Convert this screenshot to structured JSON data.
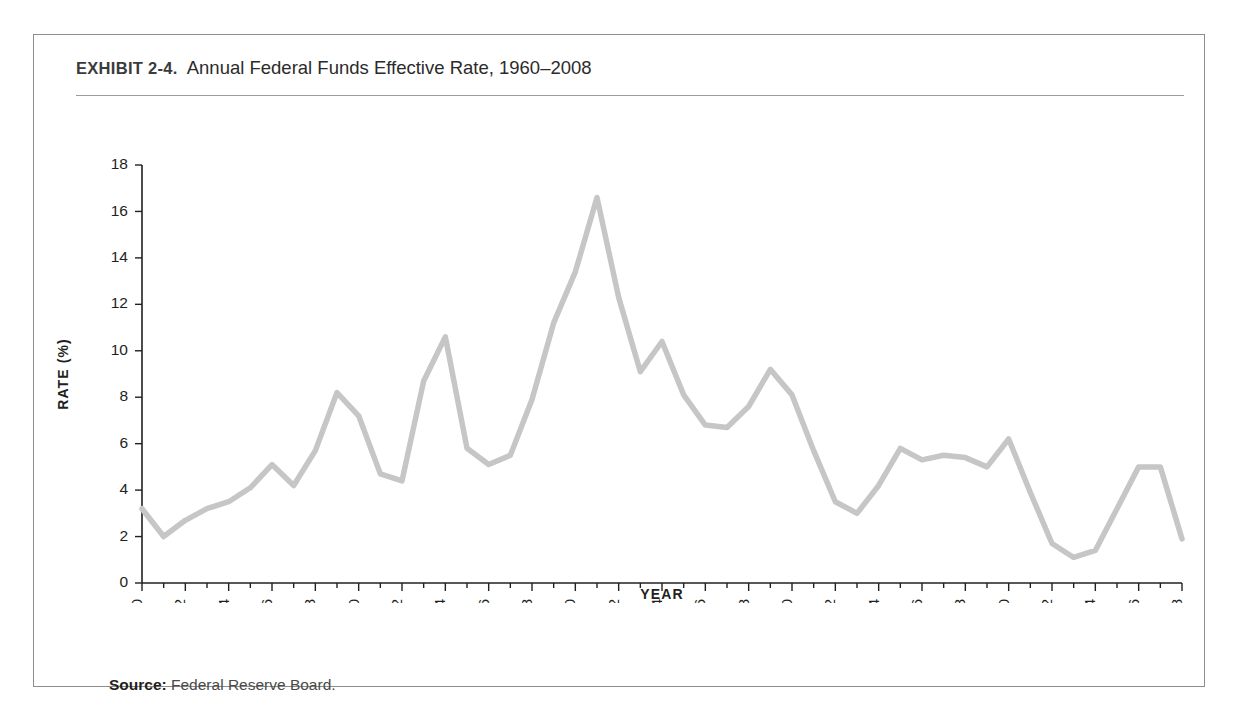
{
  "exhibit": {
    "label": "EXHIBIT 2-4.",
    "title": "Annual Federal Funds Effective Rate, 1960–2008"
  },
  "source": {
    "prefix": "Source:",
    "text": "Federal Reserve Board."
  },
  "colors": {
    "line": "#c6c6c6",
    "axis": "#231f20",
    "frame": "#8d8d8d",
    "rule": "#9c9c9c",
    "background": "#ffffff"
  },
  "chart_data": {
    "type": "line",
    "title": "Annual Federal Funds Effective Rate, 1960–2008",
    "xlabel": "YEAR",
    "ylabel": "RATE (%)",
    "ylim": [
      0,
      18
    ],
    "ytick_values": [
      0,
      2,
      4,
      6,
      8,
      10,
      12,
      14,
      16,
      18
    ],
    "ytick_labels": [
      "0",
      "2",
      "4",
      "6",
      "8",
      "10",
      "12",
      "14",
      "16",
      "18"
    ],
    "xlim": [
      1960,
      2008
    ],
    "xtick_values": [
      1960,
      1962,
      1964,
      1966,
      1968,
      1970,
      1972,
      1974,
      1976,
      1978,
      1980,
      1982,
      1984,
      1986,
      1988,
      1990,
      1992,
      1994,
      1996,
      1998,
      2000,
      2002,
      2004,
      2006,
      2008
    ],
    "xtick_labels": [
      "1960",
      "1962",
      "1964",
      "1966",
      "1968",
      "1970",
      "1972",
      "1974",
      "1976",
      "1978",
      "1980",
      "1982",
      "1984",
      "1986",
      "1988",
      "1990",
      "1992",
      "1994",
      "1996",
      "1998",
      "2000",
      "2002",
      "2004",
      "2006",
      "2008"
    ],
    "xtick_rotation": 90,
    "grid": false,
    "legend": "none",
    "x": [
      1960,
      1961,
      1962,
      1963,
      1964,
      1965,
      1966,
      1967,
      1968,
      1969,
      1970,
      1971,
      1972,
      1973,
      1974,
      1975,
      1976,
      1977,
      1978,
      1979,
      1980,
      1981,
      1982,
      1983,
      1984,
      1985,
      1986,
      1987,
      1988,
      1989,
      1990,
      1991,
      1992,
      1993,
      1994,
      1995,
      1996,
      1997,
      1998,
      1999,
      2000,
      2001,
      2002,
      2003,
      2004,
      2005,
      2006,
      2007,
      2008
    ],
    "values": [
      3.2,
      2.0,
      2.7,
      3.2,
      3.5,
      4.1,
      5.1,
      4.2,
      5.7,
      8.2,
      7.2,
      4.7,
      4.4,
      8.7,
      10.6,
      5.8,
      5.1,
      5.5,
      7.9,
      11.2,
      13.4,
      16.6,
      12.3,
      9.1,
      10.4,
      8.1,
      6.8,
      6.7,
      7.6,
      9.2,
      8.1,
      5.7,
      3.5,
      3.0,
      4.2,
      5.8,
      5.3,
      5.5,
      5.4,
      5.0,
      6.2,
      3.9,
      1.7,
      1.1,
      1.4,
      3.2,
      5.0,
      5.0,
      1.9
    ],
    "series_name": "Federal Funds Effective Rate"
  }
}
